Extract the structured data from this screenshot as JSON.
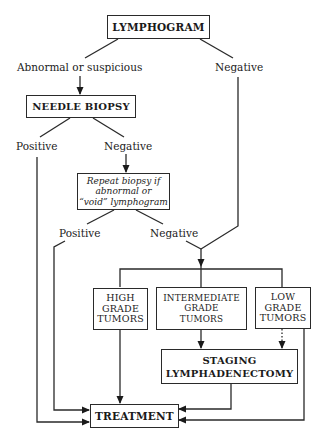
{
  "diagram": {
    "nodes": {
      "lymphogram": {
        "label": "LYMPHOGRAM"
      },
      "needle_biopsy": {
        "label": "NEEDLE BIOPSY"
      },
      "repeat_biopsy": {
        "lines": [
          "Repeat biopsy if",
          "abnormal or",
          "“void” lymphogram"
        ]
      },
      "high_grade": {
        "lines": [
          "HIGH",
          "GRADE",
          "TUMORS"
        ]
      },
      "intermediate_grade": {
        "lines": [
          "INTERMEDIATE",
          "GRADE",
          "TUMORS"
        ]
      },
      "low_grade": {
        "lines": [
          "LOW",
          "GRADE",
          "TUMORS"
        ]
      },
      "staging": {
        "lines": [
          "STAGING",
          "LYMPHADENECTOMY"
        ]
      },
      "treatment": {
        "label": "TREATMENT"
      }
    },
    "edge_labels": {
      "abnormal": "Abnormal or suspicious",
      "negative_1": "Negative",
      "positive_biopsy": "Positive",
      "negative_biopsy": "Negative",
      "positive_repeat": "Positive",
      "negative_repeat": "Negative"
    },
    "edges": [
      {
        "from": "lymphogram",
        "to": "needle_biopsy",
        "label": "Abnormal or suspicious"
      },
      {
        "from": "lymphogram",
        "to": "grade_split",
        "label": "Negative"
      },
      {
        "from": "needle_biopsy",
        "to": "treatment",
        "label": "Positive"
      },
      {
        "from": "needle_biopsy",
        "to": "repeat_biopsy",
        "label": "Negative"
      },
      {
        "from": "repeat_biopsy",
        "to": "treatment",
        "label": "Positive"
      },
      {
        "from": "repeat_biopsy",
        "to": "grade_split",
        "label": "Negative"
      },
      {
        "from": "grade_split",
        "to": "high_grade"
      },
      {
        "from": "grade_split",
        "to": "intermediate_grade"
      },
      {
        "from": "grade_split",
        "to": "low_grade"
      },
      {
        "from": "high_grade",
        "to": "treatment"
      },
      {
        "from": "intermediate_grade",
        "to": "staging"
      },
      {
        "from": "low_grade",
        "to": "staging",
        "style": "dotted"
      },
      {
        "from": "low_grade",
        "to": "treatment"
      },
      {
        "from": "staging",
        "to": "treatment"
      }
    ],
    "colors": {
      "line": "#2a2a2a",
      "background": "#ffffff"
    }
  }
}
